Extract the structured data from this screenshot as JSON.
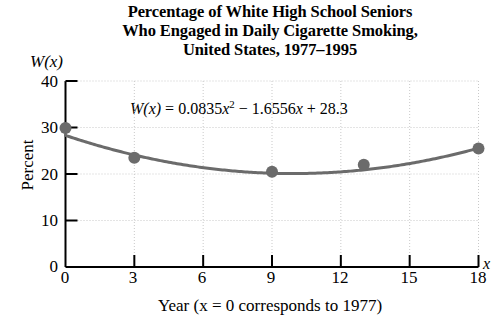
{
  "figure": {
    "title_lines": [
      "Percentage of White High School Seniors",
      "Who Engaged in Daily Cigarette Smoking,",
      "United States, 1977–1995"
    ],
    "function_label": "W(x)",
    "x_variable_label": "x",
    "equation": "W(x) = 0.0835x² − 1.6556x + 28.3",
    "equation_parts": {
      "lhs": "W(x)",
      "eq": "=",
      "a": "0.0835",
      "x_sq": "x",
      "exp": "2",
      "minus": "−",
      "b": "1.6556",
      "x_lin": "x",
      "plus": "+",
      "c": "28.3"
    },
    "colors": {
      "curve": "#6b6b6b",
      "point": "#6b6b6b",
      "axis": "#000000",
      "grid": "#c9c9c9",
      "background": "#ffffff"
    }
  },
  "chart_data": {
    "type": "scatter",
    "title": "Percentage of White High School Seniors Who Engaged in Daily Cigarette Smoking, United States, 1977–1995",
    "xlabel": "Year (x = 0 corresponds to 1977)",
    "ylabel": "Percent",
    "xlim": [
      0,
      18
    ],
    "ylim": [
      0,
      40
    ],
    "xticks": [
      0,
      3,
      6,
      9,
      12,
      15,
      18
    ],
    "yticks": [
      0,
      10,
      20,
      30,
      40
    ],
    "xtick_labels": [
      "0",
      "3",
      "6",
      "9",
      "12",
      "15",
      "18"
    ],
    "ytick_labels": [
      "0",
      "10",
      "20",
      "30",
      "40"
    ],
    "grid": true,
    "legend": "none",
    "annotations": [
      {
        "text": "W(x) = 0.0835x² − 1.6556x + 28.3",
        "x": 9,
        "y": 36.5
      }
    ],
    "series": [
      {
        "name": "Observed data",
        "type": "scatter",
        "x": [
          0,
          3,
          9,
          13,
          18
        ],
        "y": [
          29.9,
          23.5,
          20.5,
          22.0,
          25.5
        ]
      },
      {
        "name": "W(x) = 0.0835x^2 - 1.6556x + 28.3",
        "type": "line",
        "model": "quadratic",
        "coefficients": {
          "a": 0.0835,
          "b": -1.6556,
          "c": 28.3
        },
        "x": [
          0,
          1,
          2,
          3,
          4,
          5,
          6,
          7,
          8,
          9,
          10,
          11,
          12,
          13,
          14,
          15,
          16,
          17,
          18
        ],
        "y": [
          28.3,
          26.73,
          25.32,
          24.08,
          23.01,
          22.11,
          21.37,
          20.8,
          20.4,
          20.16,
          20.09,
          20.19,
          20.45,
          20.88,
          21.48,
          22.24,
          23.17,
          24.27,
          25.53
        ]
      }
    ]
  }
}
